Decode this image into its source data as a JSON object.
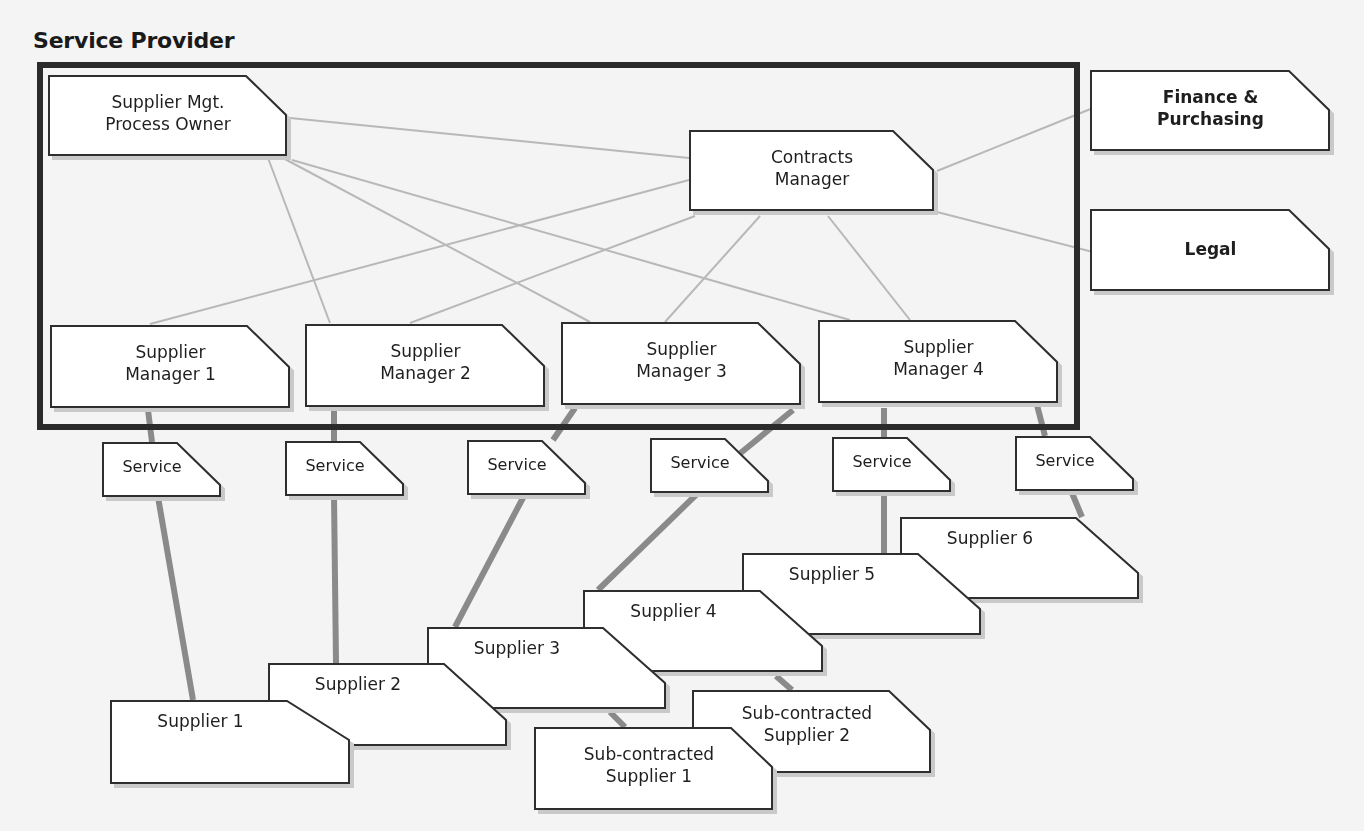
{
  "title": "Service Provider",
  "colors": {
    "background": "#f4f4f4",
    "frame_border": "#2b2b2b",
    "box_fill": "#ffffff",
    "box_border": "#2e2e2e",
    "thin_line": "#b8b8b8",
    "thick_line": "#8a8a8a",
    "shadow": "#c9c9c9"
  },
  "nodes": {
    "process_owner": "Supplier Mgt.\nProcess Owner",
    "contracts_manager": "Contracts\nManager",
    "finance": "Finance &\nPurchasing",
    "legal": "Legal",
    "supplier_manager_1": "Supplier\nManager 1",
    "supplier_manager_2": "Supplier\nManager 2",
    "supplier_manager_3": "Supplier\nManager 3",
    "supplier_manager_4": "Supplier\nManager 4",
    "service_1": "Service",
    "service_2": "Service",
    "service_3": "Service",
    "service_4": "Service",
    "service_5": "Service",
    "service_6": "Service",
    "supplier_1": "Supplier 1",
    "supplier_2": "Supplier 2",
    "supplier_3": "Supplier 3",
    "supplier_4": "Supplier 4",
    "supplier_5": "Supplier 5",
    "supplier_6": "Supplier 6",
    "subcontracted_1": "Sub-contracted\nSupplier 1",
    "subcontracted_2": "Sub-contracted\nSupplier 2"
  },
  "edges": {
    "thin": [
      [
        "process_owner",
        "contracts_manager"
      ],
      [
        "process_owner",
        "supplier_manager_2"
      ],
      [
        "process_owner",
        "supplier_manager_3"
      ],
      [
        "process_owner",
        "supplier_manager_4"
      ],
      [
        "contracts_manager",
        "supplier_manager_1"
      ],
      [
        "contracts_manager",
        "supplier_manager_2"
      ],
      [
        "contracts_manager",
        "supplier_manager_3"
      ],
      [
        "contracts_manager",
        "supplier_manager_4"
      ],
      [
        "contracts_manager",
        "finance"
      ],
      [
        "contracts_manager",
        "legal"
      ]
    ],
    "thick": [
      [
        "supplier_manager_1",
        "service_1",
        "supplier_1"
      ],
      [
        "supplier_manager_2",
        "service_2",
        "supplier_2"
      ],
      [
        "supplier_manager_3",
        "service_3",
        "supplier_3"
      ],
      [
        "supplier_manager_4",
        "service_4",
        "supplier_4"
      ],
      [
        "supplier_manager_4",
        "service_5",
        "supplier_5"
      ],
      [
        "supplier_manager_4",
        "service_6",
        "supplier_6"
      ],
      [
        "supplier_3",
        "subcontracted_1"
      ],
      [
        "supplier_4",
        "subcontracted_2"
      ]
    ]
  }
}
